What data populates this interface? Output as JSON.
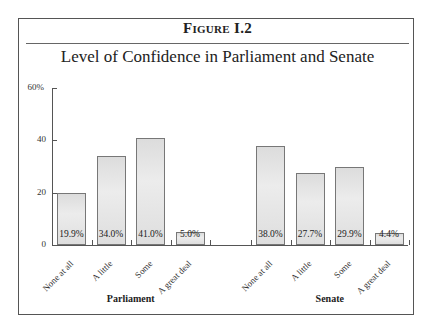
{
  "figure": {
    "label": "Figure I.2",
    "title": "Level of Confidence in Parliament and Senate"
  },
  "chart_data": {
    "type": "bar",
    "title": "Level of Confidence in Parliament and Senate",
    "xlabel": "",
    "ylabel": "",
    "ylim": [
      0,
      60
    ],
    "yticks": [
      "0",
      "20",
      "40",
      "60%"
    ],
    "grid": false,
    "legend": "none",
    "categories": [
      "None at all",
      "A little",
      "Some",
      "A great deal"
    ],
    "series": [
      {
        "name": "Parliament",
        "values": [
          19.9,
          34.0,
          41.0,
          5.0
        ],
        "labels": [
          "19.9%",
          "34.0%",
          "41.0%",
          "5.0%"
        ]
      },
      {
        "name": "Senate",
        "values": [
          38.0,
          27.7,
          29.9,
          4.4
        ],
        "labels": [
          "38.0%",
          "27.7%",
          "29.9%",
          "4.4%"
        ]
      }
    ]
  },
  "colors": {
    "bar_fill": "#e2e2e2",
    "bar_border": "#777777",
    "axis": "#555555"
  }
}
